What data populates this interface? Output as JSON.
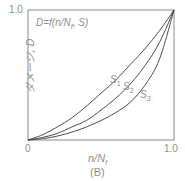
{
  "chart_data": {
    "type": "line",
    "title": "",
    "caption": "(B)",
    "formula": "D=f(n/N",
    "formula_sub": "f",
    "formula_tail": ", S)",
    "xlabel": "n/N",
    "xlabel_sub": "f",
    "ylabel": "ダメージ, D",
    "xlim": [
      0,
      1.0
    ],
    "ylim": [
      0,
      1.0
    ],
    "x_ticks": [
      "0",
      "1.0"
    ],
    "y_ticks": [
      "1.0"
    ],
    "grid": false,
    "legend": "inline labels",
    "x": [
      0,
      0.1,
      0.2,
      0.3,
      0.4,
      0.5,
      0.6,
      0.7,
      0.8,
      0.9,
      1.0
    ],
    "series": [
      {
        "name": "S1",
        "label": "S",
        "sub": "1",
        "values": [
          0,
          0.04,
          0.1,
          0.17,
          0.26,
          0.36,
          0.46,
          0.58,
          0.7,
          0.84,
          1.0
        ]
      },
      {
        "name": "S2",
        "label": "S",
        "sub": "2",
        "values": [
          0,
          0.02,
          0.05,
          0.1,
          0.15,
          0.23,
          0.32,
          0.43,
          0.57,
          0.75,
          1.0
        ]
      },
      {
        "name": "S3",
        "label": "S",
        "sub": "3",
        "values": [
          0,
          0.01,
          0.03,
          0.06,
          0.1,
          0.15,
          0.21,
          0.29,
          0.42,
          0.62,
          1.0
        ]
      }
    ]
  }
}
